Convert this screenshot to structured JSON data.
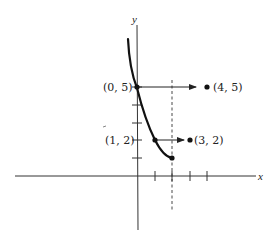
{
  "diagram": {
    "axes": {
      "x_label": "x",
      "y_label": "y"
    },
    "points": [
      {
        "id": "p05",
        "label": "(0, 5)",
        "x": 0,
        "y": 5
      },
      {
        "id": "p12",
        "label": "(1, 2)",
        "x": 1,
        "y": 2
      },
      {
        "id": "p45",
        "label": "(4, 5)",
        "x": 4,
        "y": 5
      },
      {
        "id": "p32",
        "label": "(3, 2)",
        "x": 3,
        "y": 2
      },
      {
        "id": "end",
        "label": "",
        "x": 2,
        "y": 1
      }
    ],
    "arrows": [
      {
        "from": "(0, 5)",
        "to": "(4, 5)"
      },
      {
        "from": "(1, 2)",
        "to": "(3, 2)"
      }
    ],
    "dashed_line": {
      "x": 2
    },
    "x_ticks": [
      1,
      2,
      3,
      4
    ],
    "y_ticks": [
      1,
      2,
      3,
      4,
      5
    ],
    "colors": {
      "stroke": "#222222",
      "background": "#ffffff"
    }
  }
}
